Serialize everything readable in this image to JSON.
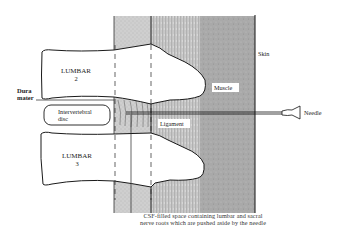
{
  "diagram": {
    "labels": {
      "lumbar2_line1": "LUMBAR",
      "lumbar2_line2": "2",
      "lumbar3_line1": "LUMBAR",
      "lumbar3_line2": "3",
      "dura_line1": "Dura",
      "dura_line2": "mater",
      "disc_line1": "Intervertebral",
      "disc_line2": "disc",
      "ligament": "Ligament",
      "muscle": "Muscle",
      "skin": "Skin",
      "needle": "Needle"
    },
    "caption": {
      "line1": "CSF-filled space containing lumbar and sacral",
      "line2": "nerve roots which are pushed aside by the needle"
    },
    "colors": {
      "dura_band": "#c8c8c8",
      "ligament_band": "#b4b4b4",
      "muscle_band": "#a8a8a8",
      "bone": "#ffffff",
      "outline": "#1a1a1a"
    }
  }
}
